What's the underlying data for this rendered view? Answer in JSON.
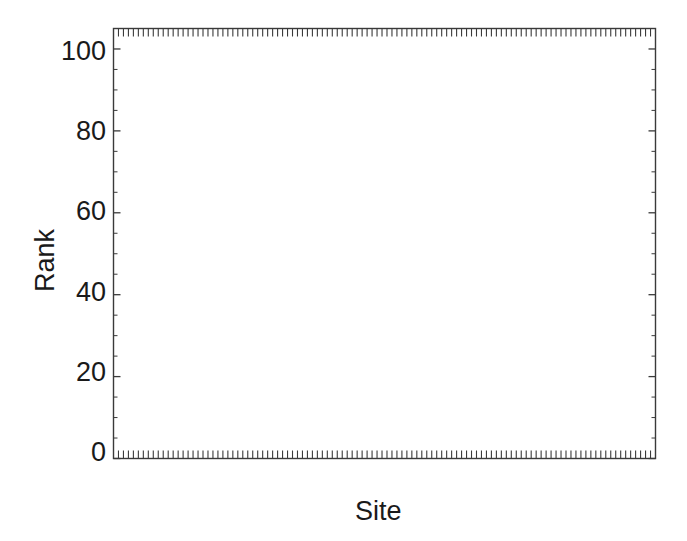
{
  "chart_data": {
    "type": "box",
    "title": "",
    "xlabel": "Site",
    "ylabel": "Rank",
    "ylim": [
      0,
      105
    ],
    "xlim": [
      0,
      109
    ],
    "grid": false,
    "legend": null,
    "y_ticks": [
      0,
      20,
      40,
      60,
      80,
      100
    ],
    "y_tick_labels": [
      "0",
      "20",
      "40",
      "60",
      "80",
      "100"
    ],
    "x_ticks_visible": true,
    "x_tick_labels": [],
    "n_boxes": 108,
    "boxes": [
      {
        "i": 1,
        "lo": 0.4,
        "q1": 1.2,
        "med": 2.0,
        "q3": 3.2,
        "hi": 7.5
      },
      {
        "i": 2,
        "lo": 0.5,
        "q1": 1.4,
        "med": 2.2,
        "q3": 4.0,
        "hi": 12.0
      },
      {
        "i": 3,
        "lo": 0.4,
        "q1": 1.3,
        "med": 2.1,
        "q3": 3.6,
        "hi": 8.0
      },
      {
        "i": 4,
        "lo": 0.5,
        "q1": 1.6,
        "med": 2.6,
        "q3": 4.3,
        "hi": 9.0
      },
      {
        "i": 5,
        "lo": 0.4,
        "q1": 1.2,
        "med": 2.0,
        "q3": 3.0,
        "hi": 6.5
      },
      {
        "i": 6,
        "lo": 0.5,
        "q1": 1.8,
        "med": 2.8,
        "q3": 4.6,
        "hi": 10.5
      },
      {
        "i": 7,
        "lo": 0.5,
        "q1": 1.5,
        "med": 2.4,
        "q3": 4.0,
        "hi": 8.5
      },
      {
        "i": 8,
        "lo": 0.4,
        "q1": 1.1,
        "med": 1.9,
        "q3": 3.0,
        "hi": 6.0
      },
      {
        "i": 9,
        "lo": 0.6,
        "q1": 2.0,
        "med": 3.2,
        "q3": 5.0,
        "hi": 11.0
      },
      {
        "i": 10,
        "lo": 0.4,
        "q1": 1.0,
        "med": 1.6,
        "q3": 2.4,
        "hi": 4.5
      },
      {
        "i": 11,
        "lo": 0.4,
        "q1": 1.0,
        "med": 1.5,
        "q3": 2.2,
        "hi": 4.0
      },
      {
        "i": 12,
        "lo": 0.5,
        "q1": 1.4,
        "med": 2.2,
        "q3": 3.4,
        "hi": 6.0
      },
      {
        "i": 13,
        "lo": 0.5,
        "q1": 1.6,
        "med": 2.6,
        "q3": 4.2,
        "hi": 7.5
      },
      {
        "i": 14,
        "lo": 0.5,
        "q1": 1.8,
        "med": 3.0,
        "q3": 5.0,
        "hi": 9.0
      },
      {
        "i": 15,
        "lo": 0.6,
        "q1": 2.0,
        "med": 3.4,
        "q3": 6.0,
        "hi": 13.0
      },
      {
        "i": 16,
        "lo": 0.8,
        "q1": 3.0,
        "med": 6.0,
        "q3": 16.5,
        "hi": 40.0
      },
      {
        "i": 17,
        "lo": 0.6,
        "q1": 2.0,
        "med": 3.4,
        "q3": 6.0,
        "hi": 13.5
      },
      {
        "i": 18,
        "lo": 0.6,
        "q1": 2.2,
        "med": 3.6,
        "q3": 6.2,
        "hi": 14.0
      },
      {
        "i": 19,
        "lo": 0.6,
        "q1": 2.4,
        "med": 3.8,
        "q3": 6.6,
        "hi": 16.0
      },
      {
        "i": 20,
        "lo": 0.7,
        "q1": 2.6,
        "med": 4.2,
        "q3": 7.2,
        "hi": 18.0
      },
      {
        "i": 21,
        "lo": 0.6,
        "q1": 2.2,
        "med": 3.6,
        "q3": 6.0,
        "hi": 14.0
      },
      {
        "i": 22,
        "lo": 0.7,
        "q1": 2.6,
        "med": 4.4,
        "q3": 7.6,
        "hi": 19.5
      },
      {
        "i": 23,
        "lo": 0.7,
        "q1": 2.8,
        "med": 4.6,
        "q3": 8.0,
        "hi": 21.0
      },
      {
        "i": 24,
        "lo": 0.6,
        "q1": 2.4,
        "med": 4.0,
        "q3": 6.8,
        "hi": 16.0
      },
      {
        "i": 25,
        "lo": 0.8,
        "q1": 3.0,
        "med": 5.0,
        "q3": 9.0,
        "hi": 24.0
      },
      {
        "i": 26,
        "lo": 0.7,
        "q1": 2.6,
        "med": 4.4,
        "q3": 7.4,
        "hi": 18.0
      },
      {
        "i": 27,
        "lo": 0.7,
        "q1": 2.8,
        "med": 4.8,
        "q3": 8.2,
        "hi": 22.0
      },
      {
        "i": 28,
        "lo": 0.8,
        "q1": 3.2,
        "med": 5.2,
        "q3": 9.4,
        "hi": 28.0
      },
      {
        "i": 29,
        "lo": 0.7,
        "q1": 2.8,
        "med": 4.6,
        "q3": 8.0,
        "hi": 20.0
      },
      {
        "i": 30,
        "lo": 0.9,
        "q1": 3.4,
        "med": 5.6,
        "q3": 10.0,
        "hi": 27.5
      },
      {
        "i": 31,
        "lo": 0.8,
        "q1": 3.0,
        "med": 5.0,
        "q3": 8.8,
        "hi": 23.0
      },
      {
        "i": 32,
        "lo": 0.8,
        "q1": 3.2,
        "med": 5.4,
        "q3": 9.6,
        "hi": 26.0
      },
      {
        "i": 33,
        "lo": 1.0,
        "q1": 4.0,
        "med": 7.0,
        "q3": 13.0,
        "hi": 66.0
      },
      {
        "i": 34,
        "lo": 0.8,
        "q1": 3.0,
        "med": 5.0,
        "q3": 8.6,
        "hi": 21.0
      },
      {
        "i": 35,
        "lo": 0.9,
        "q1": 3.6,
        "med": 6.0,
        "q3": 10.6,
        "hi": 29.0
      },
      {
        "i": 36,
        "lo": 1.0,
        "q1": 4.2,
        "med": 7.2,
        "q3": 13.0,
        "hi": 65.5
      },
      {
        "i": 37,
        "lo": 0.9,
        "q1": 3.4,
        "med": 5.6,
        "q3": 10.0,
        "hi": 25.0
      },
      {
        "i": 38,
        "lo": 0.9,
        "q1": 3.6,
        "med": 6.0,
        "q3": 10.4,
        "hi": 27.0
      },
      {
        "i": 39,
        "lo": 0.8,
        "q1": 3.2,
        "med": 5.4,
        "q3": 9.2,
        "hi": 23.0
      },
      {
        "i": 40,
        "lo": 1.0,
        "q1": 4.0,
        "med": 6.6,
        "q3": 11.6,
        "hi": 30.0
      },
      {
        "i": 41,
        "lo": 0.9,
        "q1": 3.4,
        "med": 5.8,
        "q3": 10.0,
        "hi": 25.0
      },
      {
        "i": 42,
        "lo": 1.0,
        "q1": 4.0,
        "med": 6.8,
        "q3": 12.0,
        "hi": 32.0
      },
      {
        "i": 43,
        "lo": 1.0,
        "q1": 4.4,
        "med": 7.4,
        "q3": 13.0,
        "hi": 35.0
      },
      {
        "i": 44,
        "lo": 0.9,
        "q1": 3.6,
        "med": 6.0,
        "q3": 10.4,
        "hi": 26.0
      },
      {
        "i": 45,
        "lo": 1.1,
        "q1": 4.6,
        "med": 7.8,
        "q3": 13.6,
        "hi": 36.0
      },
      {
        "i": 46,
        "lo": 1.0,
        "q1": 4.0,
        "med": 6.8,
        "q3": 11.8,
        "hi": 30.0
      },
      {
        "i": 47,
        "lo": 1.1,
        "q1": 4.8,
        "med": 8.0,
        "q3": 14.0,
        "hi": 38.0
      },
      {
        "i": 48,
        "lo": 1.0,
        "q1": 4.2,
        "med": 7.0,
        "q3": 12.4,
        "hi": 33.0
      },
      {
        "i": 49,
        "lo": 1.2,
        "q1": 5.0,
        "med": 8.4,
        "q3": 15.0,
        "hi": 42.0
      },
      {
        "i": 50,
        "lo": 1.1,
        "q1": 4.4,
        "med": 7.4,
        "q3": 13.0,
        "hi": 34.0
      },
      {
        "i": 51,
        "lo": 1.2,
        "q1": 5.2,
        "med": 8.8,
        "q3": 16.0,
        "hi": 44.0
      },
      {
        "i": 52,
        "lo": 1.1,
        "q1": 4.6,
        "med": 7.8,
        "q3": 13.4,
        "hi": 35.0
      },
      {
        "i": 53,
        "lo": 1.3,
        "q1": 5.6,
        "med": 9.4,
        "q3": 17.0,
        "hi": 46.0
      },
      {
        "i": 54,
        "lo": 1.4,
        "q1": 6.0,
        "med": 10.0,
        "q3": 18.0,
        "hi": 49.0
      },
      {
        "i": 55,
        "lo": 1.6,
        "q1": 6.6,
        "med": 11.0,
        "q3": 19.5,
        "hi": 100.0
      },
      {
        "i": 56,
        "lo": 1.2,
        "q1": 5.0,
        "med": 8.6,
        "q3": 15.0,
        "hi": 40.0
      },
      {
        "i": 57,
        "lo": 1.3,
        "q1": 5.4,
        "med": 9.2,
        "q3": 16.4,
        "hi": 43.0
      },
      {
        "i": 58,
        "lo": 1.2,
        "q1": 5.2,
        "med": 8.8,
        "q3": 15.6,
        "hi": 41.0
      },
      {
        "i": 59,
        "lo": 1.4,
        "q1": 6.0,
        "med": 10.0,
        "q3": 17.6,
        "hi": 47.0
      },
      {
        "i": 60,
        "lo": 1.3,
        "q1": 5.6,
        "med": 9.6,
        "q3": 17.0,
        "hi": 45.0
      },
      {
        "i": 61,
        "lo": 1.5,
        "q1": 6.2,
        "med": 10.4,
        "q3": 18.4,
        "hi": 48.0
      },
      {
        "i": 62,
        "lo": 1.4,
        "q1": 5.8,
        "med": 9.8,
        "q3": 17.2,
        "hi": 45.5
      },
      {
        "i": 63,
        "lo": 1.5,
        "q1": 6.4,
        "med": 10.8,
        "q3": 19.0,
        "hi": 51.0
      },
      {
        "i": 64,
        "lo": 1.3,
        "q1": 5.4,
        "med": 9.0,
        "q3": 16.0,
        "hi": 42.0
      },
      {
        "i": 65,
        "lo": 1.6,
        "q1": 6.8,
        "med": 11.4,
        "q3": 20.0,
        "hi": 53.0
      },
      {
        "i": 66,
        "lo": 1.4,
        "q1": 6.0,
        "med": 10.0,
        "q3": 18.0,
        "hi": 47.5
      },
      {
        "i": 67,
        "lo": 1.7,
        "q1": 7.0,
        "med": 11.8,
        "q3": 21.0,
        "hi": 56.0
      },
      {
        "i": 68,
        "lo": 1.5,
        "q1": 6.4,
        "med": 10.6,
        "q3": 19.0,
        "hi": 50.0
      },
      {
        "i": 69,
        "lo": 1.8,
        "q1": 7.4,
        "med": 12.4,
        "q3": 22.0,
        "hi": 58.0
      },
      {
        "i": 70,
        "lo": 1.6,
        "q1": 6.8,
        "med": 11.2,
        "q3": 20.0,
        "hi": 52.0
      },
      {
        "i": 71,
        "lo": 2.0,
        "q1": 8.0,
        "med": 13.4,
        "q3": 23.5,
        "hi": 92.0
      },
      {
        "i": 72,
        "lo": 1.5,
        "q1": 6.2,
        "med": 10.4,
        "q3": 18.6,
        "hi": 49.0
      },
      {
        "i": 73,
        "lo": 1.8,
        "q1": 7.6,
        "med": 12.6,
        "q3": 22.4,
        "hi": 59.0
      },
      {
        "i": 74,
        "lo": 1.6,
        "q1": 7.0,
        "med": 11.6,
        "q3": 20.6,
        "hi": 54.0
      },
      {
        "i": 75,
        "lo": 1.9,
        "q1": 8.0,
        "med": 13.2,
        "q3": 23.4,
        "hi": 61.0
      },
      {
        "i": 76,
        "lo": 1.4,
        "q1": 6.0,
        "med": 10.0,
        "q3": 18.0,
        "hi": 48.0
      },
      {
        "i": 77,
        "lo": 2.0,
        "q1": 8.4,
        "med": 14.0,
        "q3": 24.6,
        "hi": 64.0
      },
      {
        "i": 78,
        "lo": 1.7,
        "q1": 7.2,
        "med": 12.0,
        "q3": 21.4,
        "hi": 56.5
      },
      {
        "i": 79,
        "lo": 2.1,
        "q1": 8.6,
        "med": 14.4,
        "q3": 25.4,
        "hi": 66.0
      },
      {
        "i": 80,
        "lo": 1.9,
        "q1": 8.0,
        "med": 13.4,
        "q3": 23.6,
        "hi": 62.0
      },
      {
        "i": 81,
        "lo": 2.2,
        "q1": 9.0,
        "med": 15.0,
        "q3": 26.4,
        "hi": 69.0
      },
      {
        "i": 82,
        "lo": 1.8,
        "q1": 7.6,
        "med": 12.8,
        "q3": 22.6,
        "hi": 59.5
      },
      {
        "i": 83,
        "lo": 2.3,
        "q1": 9.4,
        "med": 15.6,
        "q3": 27.4,
        "hi": 72.0
      },
      {
        "i": 84,
        "lo": 2.0,
        "q1": 8.4,
        "med": 14.0,
        "q3": 24.8,
        "hi": 65.0
      },
      {
        "i": 85,
        "lo": 2.4,
        "q1": 9.8,
        "med": 16.2,
        "q3": 28.4,
        "hi": 74.0
      },
      {
        "i": 86,
        "lo": 2.1,
        "q1": 8.8,
        "med": 14.6,
        "q3": 25.8,
        "hi": 68.0
      },
      {
        "i": 87,
        "lo": 2.6,
        "q1": 10.6,
        "med": 17.4,
        "q3": 30.0,
        "hi": 89.0
      },
      {
        "i": 88,
        "lo": 2.2,
        "q1": 9.2,
        "med": 15.2,
        "q3": 27.0,
        "hi": 71.0
      },
      {
        "i": 89,
        "lo": 2.5,
        "q1": 10.2,
        "med": 16.8,
        "q3": 29.4,
        "hi": 77.0
      },
      {
        "i": 90,
        "lo": 2.3,
        "q1": 9.6,
        "med": 15.8,
        "q3": 28.0,
        "hi": 73.0
      },
      {
        "i": 91,
        "lo": 2.7,
        "q1": 11.0,
        "med": 18.0,
        "q3": 31.0,
        "hi": 81.0
      },
      {
        "i": 92,
        "lo": 2.4,
        "q1": 10.0,
        "med": 16.4,
        "q3": 29.0,
        "hi": 76.0
      },
      {
        "i": 93,
        "lo": 2.8,
        "q1": 11.4,
        "med": 18.6,
        "q3": 32.0,
        "hi": 84.0
      },
      {
        "i": 94,
        "lo": 3.0,
        "q1": 12.0,
        "med": 19.6,
        "q3": 34.0,
        "hi": 98.0
      },
      {
        "i": 95,
        "lo": 2.6,
        "q1": 10.6,
        "med": 17.4,
        "q3": 30.4,
        "hi": 79.0
      },
      {
        "i": 96,
        "lo": 2.9,
        "q1": 11.8,
        "med": 19.2,
        "q3": 33.0,
        "hi": 86.0
      },
      {
        "i": 97,
        "lo": 2.5,
        "q1": 10.4,
        "med": 17.0,
        "q3": 30.0,
        "hi": 78.0
      },
      {
        "i": 98,
        "lo": 3.1,
        "q1": 12.4,
        "med": 20.2,
        "q3": 35.0,
        "hi": 90.0
      },
      {
        "i": 99,
        "lo": 2.8,
        "q1": 11.6,
        "med": 19.0,
        "q3": 33.0,
        "hi": 85.0
      },
      {
        "i": 100,
        "lo": 3.2,
        "q1": 13.0,
        "med": 21.0,
        "q3": 36.0,
        "hi": 93.0
      },
      {
        "i": 101,
        "lo": 3.0,
        "q1": 12.2,
        "med": 20.0,
        "q3": 34.6,
        "hi": 89.0
      },
      {
        "i": 102,
        "lo": 3.4,
        "q1": 13.6,
        "med": 22.0,
        "q3": 38.0,
        "hi": 96.0
      },
      {
        "i": 103,
        "lo": 3.1,
        "q1": 12.6,
        "med": 20.6,
        "q3": 35.6,
        "hi": 91.0
      },
      {
        "i": 104,
        "lo": 3.6,
        "q1": 14.4,
        "med": 23.0,
        "q3": 39.5,
        "hi": 99.0
      },
      {
        "i": 105,
        "lo": 3.3,
        "q1": 13.2,
        "med": 21.4,
        "q3": 37.0,
        "hi": 94.0
      },
      {
        "i": 106,
        "lo": 3.8,
        "q1": 15.0,
        "med": 24.0,
        "q3": 41.0,
        "hi": 100.0
      },
      {
        "i": 107,
        "lo": 4.0,
        "q1": 16.0,
        "med": 25.5,
        "q3": 43.0,
        "hi": 60.0
      },
      {
        "i": 108,
        "lo": 5.0,
        "q1": 20.0,
        "med": 33.0,
        "q3": 47.5,
        "hi": 81.0
      }
    ]
  },
  "axes": {
    "ylabel": "Rank",
    "xlabel": "Site",
    "y_tick_labels": [
      "100",
      "80",
      "60",
      "40",
      "20",
      "0"
    ],
    "colors": {
      "ink": "#1a1a1a",
      "frame": "#3a3a3a",
      "box": "#4a4a4a",
      "background": "#ffffff"
    }
  }
}
